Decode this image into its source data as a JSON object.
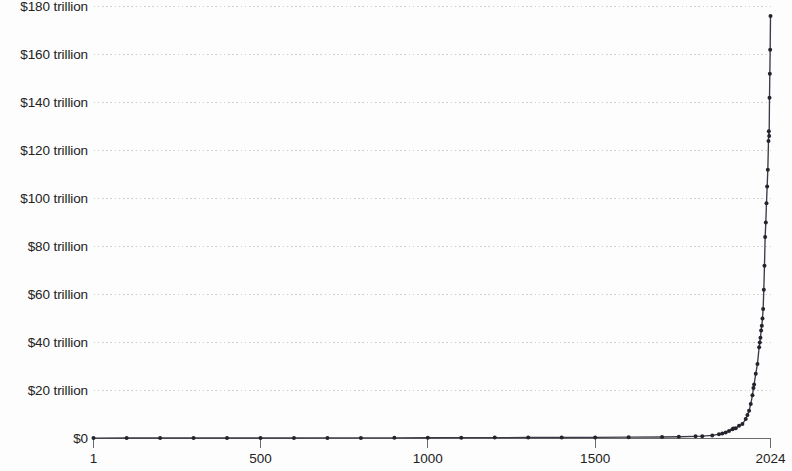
{
  "chart_data": {
    "type": "line",
    "title": "",
    "subtitle": "",
    "xlabel": "",
    "ylabel": "",
    "xlim": [
      1,
      2024
    ],
    "ylim": [
      0,
      180
    ],
    "y_unit": "trillion USD",
    "grid": true,
    "legend": false,
    "x_ticks": [
      1,
      500,
      1000,
      1500,
      2024
    ],
    "x_tick_labels": [
      "1",
      "500",
      "1000",
      "1500",
      "2024"
    ],
    "y_ticks": [
      0,
      20,
      40,
      60,
      80,
      100,
      120,
      140,
      160,
      180
    ],
    "y_tick_labels": [
      "$0",
      "$20 trillion",
      "$40 trillion",
      "$60 trillion",
      "$80 trillion",
      "$100 trillion",
      "$120 trillion",
      "$140 trillion",
      "$160 trillion",
      "$180 trillion"
    ],
    "series": [
      {
        "name": "World GDP",
        "x": [
          1,
          100,
          200,
          300,
          400,
          500,
          600,
          700,
          800,
          900,
          1000,
          1100,
          1200,
          1300,
          1400,
          1500,
          1600,
          1700,
          1750,
          1800,
          1820,
          1850,
          1870,
          1880,
          1890,
          1900,
          1910,
          1913,
          1920,
          1930,
          1940,
          1950,
          1955,
          1960,
          1965,
          1970,
          1973,
          1975,
          1980,
          1985,
          1990,
          1992,
          1994,
          1996,
          1998,
          2000,
          2002,
          2004,
          2006,
          2008,
          2010,
          2012,
          2014,
          2016,
          2018,
          2019,
          2020,
          2021,
          2022,
          2023,
          2024
        ],
        "values": [
          0.18,
          0.2,
          0.21,
          0.21,
          0.2,
          0.21,
          0.22,
          0.24,
          0.26,
          0.28,
          0.31,
          0.34,
          0.38,
          0.4,
          0.42,
          0.46,
          0.56,
          0.64,
          0.73,
          0.9,
          0.96,
          1.3,
          1.8,
          2.1,
          2.5,
          3.1,
          3.9,
          4.2,
          4.3,
          5.3,
          6.0,
          8.1,
          9.8,
          11.6,
          14.4,
          18.0,
          21.0,
          22.5,
          27.0,
          31.0,
          38.0,
          40.0,
          42.0,
          45.0,
          47.0,
          50.0,
          54.0,
          62.0,
          72.0,
          84.0,
          90.0,
          98.0,
          105.0,
          112.0,
          124.0,
          128.0,
          126.0,
          142.0,
          152.0,
          162.0,
          176.0
        ]
      }
    ]
  },
  "axes": {
    "y_axis_name": "y-axis",
    "x_axis_name": "x-axis"
  }
}
